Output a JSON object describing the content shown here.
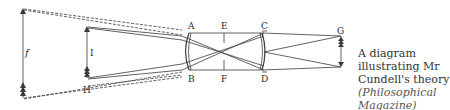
{
  "diagram": {
    "labels": {
      "A": "A",
      "B": "B",
      "C": "C",
      "D": "D",
      "E": "E",
      "F": "F",
      "G": "G",
      "H": "H",
      "I": "I",
      "f": "f"
    },
    "line_color": "#3a3a3a"
  },
  "caption": {
    "text": "A diagram illustrating Mr Cundell's theory",
    "source": "(Philosophical Magazine)"
  }
}
